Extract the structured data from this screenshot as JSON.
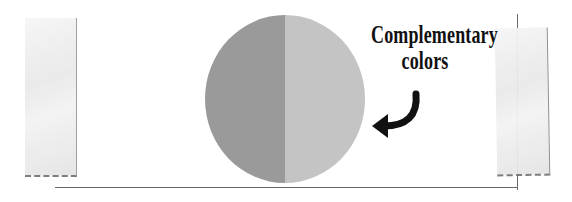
{
  "annotation": {
    "line1": "Complementary",
    "line2": "colors"
  },
  "circle": {
    "left_color": "#9a9a9a",
    "right_color": "#c4c4c4"
  },
  "icons": {
    "arrow": "curved-arrow-left"
  }
}
